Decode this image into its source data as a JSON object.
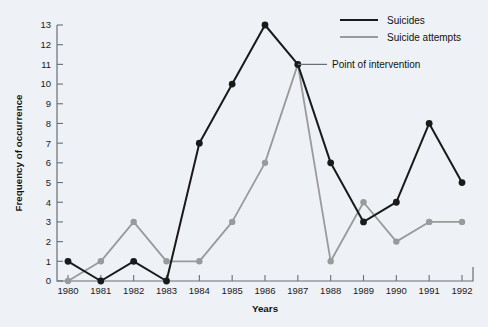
{
  "chart_data": {
    "type": "line",
    "title": "",
    "xlabel": "Years",
    "ylabel": "Frequency of occurrence",
    "x": [
      1980,
      1981,
      1982,
      1983,
      1984,
      1985,
      1986,
      1987,
      1988,
      1989,
      1990,
      1991,
      1992
    ],
    "categories": [
      "1980",
      "1981",
      "1982",
      "1983",
      "1984",
      "1985",
      "1986",
      "1987",
      "1988",
      "1989",
      "1990",
      "1991",
      "1992"
    ],
    "xlim": [
      1980,
      1992
    ],
    "ylim": [
      0,
      13
    ],
    "yticks": [
      0,
      1,
      2,
      3,
      4,
      5,
      6,
      7,
      8,
      9,
      10,
      11,
      12,
      13
    ],
    "ytick_labels": [
      "0",
      "1",
      "2",
      "3",
      "4",
      "5",
      "6",
      "7",
      "8",
      "9",
      "10",
      "11",
      "12",
      "13"
    ],
    "grid": false,
    "legend_position": "top-right",
    "series": [
      {
        "name": "Suicides",
        "color": "#1a1a1a",
        "marker": "circle",
        "values": [
          1,
          0,
          1,
          0,
          7,
          10,
          13,
          11,
          6,
          3,
          4,
          8,
          5
        ]
      },
      {
        "name": "Suicide attempts",
        "color": "#9a9a9a",
        "marker": "circle",
        "values": [
          0,
          1,
          3,
          1,
          1,
          3,
          6,
          11,
          1,
          4,
          2,
          3,
          3
        ]
      }
    ],
    "annotations": [
      {
        "text": "Point of intervention",
        "target_x": 1987,
        "target_y": 11
      }
    ]
  },
  "axes": {
    "x_axis_label": "Years",
    "y_axis_label": "Frequency of occurrence"
  },
  "legend": {
    "items": [
      {
        "label": "Suicides",
        "color": "#1a1a1a"
      },
      {
        "label": "Suicide attempts",
        "color": "#9a9a9a"
      }
    ]
  },
  "annotation": {
    "text": "Point of intervention"
  },
  "colors": {
    "background": "#eef1f5",
    "axis": "#6a6f76",
    "series_primary": "#1a1a1a",
    "series_secondary": "#9a9a9a",
    "text": "#111111"
  }
}
